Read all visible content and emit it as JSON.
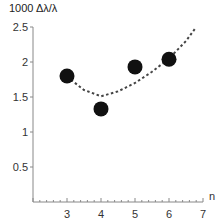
{
  "chart_data": {
    "type": "scatter",
    "title": "",
    "xlabel": "n",
    "ylabel": "1000 Δλ/λ",
    "xlim": [
      2,
      7
    ],
    "ylim": [
      0,
      2.5
    ],
    "x_ticks": [
      "3",
      "4",
      "5",
      "6",
      "7"
    ],
    "y_ticks": [
      "0.5",
      "1",
      "1.5",
      "2",
      "2.5"
    ],
    "grid": false,
    "legend": null,
    "series": [
      {
        "name": "data",
        "type": "scatter",
        "marker": "filled-circle",
        "color": "#111111",
        "x": [
          3,
          4,
          5,
          6
        ],
        "y": [
          1.8,
          1.33,
          1.93,
          2.04
        ]
      },
      {
        "name": "trend",
        "type": "line",
        "style": "dashed",
        "color": "#444444",
        "x": [
          3.0,
          3.5,
          4.0,
          4.5,
          5.0,
          5.5,
          6.0,
          6.2,
          6.5,
          6.8
        ],
        "y": [
          1.79,
          1.6,
          1.51,
          1.58,
          1.7,
          1.86,
          2.05,
          2.15,
          2.3,
          2.5
        ]
      }
    ]
  }
}
